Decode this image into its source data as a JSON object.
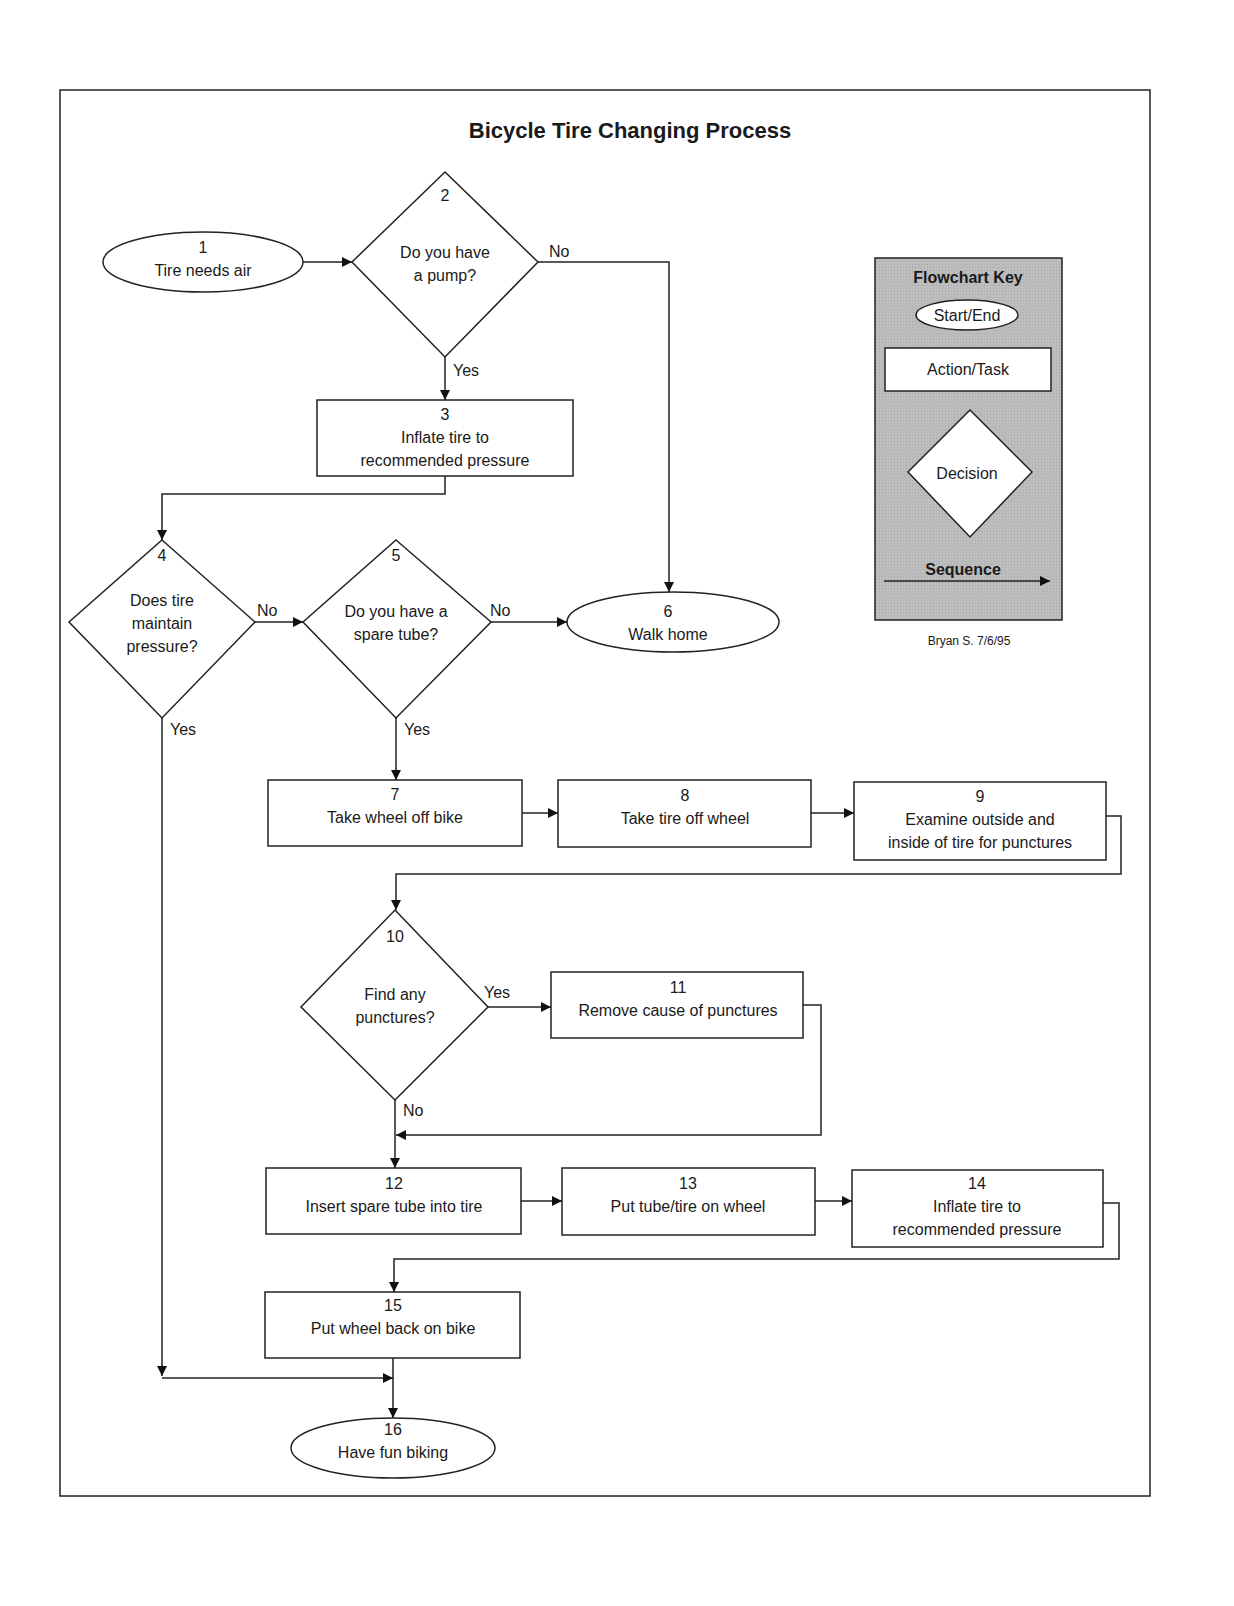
{
  "title": "Bicycle Tire Changing Process",
  "nodes": [
    {
      "id": "1",
      "type": "start-end",
      "label": "Tire needs air"
    },
    {
      "id": "2",
      "type": "decision",
      "label_lines": [
        "Do you have",
        "a pump?"
      ]
    },
    {
      "id": "3",
      "type": "action",
      "label_lines": [
        "Inflate tire to",
        "recommended pressure"
      ]
    },
    {
      "id": "4",
      "type": "decision",
      "label_lines": [
        "Does tire",
        "maintain",
        "pressure?"
      ]
    },
    {
      "id": "5",
      "type": "decision",
      "label_lines": [
        "Do you have a",
        "spare tube?"
      ]
    },
    {
      "id": "6",
      "type": "start-end",
      "label": "Walk home"
    },
    {
      "id": "7",
      "type": "action",
      "label": "Take wheel off bike"
    },
    {
      "id": "8",
      "type": "action",
      "label": "Take tire off wheel"
    },
    {
      "id": "9",
      "type": "action",
      "label_lines": [
        "Examine outside and",
        "inside of tire for punctures"
      ]
    },
    {
      "id": "10",
      "type": "decision",
      "label_lines": [
        "Find any",
        "punctures?"
      ]
    },
    {
      "id": "11",
      "type": "action",
      "label": "Remove cause of punctures"
    },
    {
      "id": "12",
      "type": "action",
      "label": "Insert spare tube into tire"
    },
    {
      "id": "13",
      "type": "action",
      "label": "Put tube/tire on wheel"
    },
    {
      "id": "14",
      "type": "action",
      "label_lines": [
        "Inflate tire to",
        "recommended pressure"
      ]
    },
    {
      "id": "15",
      "type": "action",
      "label": "Put wheel back on bike"
    },
    {
      "id": "16",
      "type": "start-end",
      "label": "Have fun biking"
    }
  ],
  "edges": [
    {
      "from": "1",
      "to": "2",
      "label": ""
    },
    {
      "from": "2",
      "to": "3",
      "label": "Yes"
    },
    {
      "from": "2",
      "to": "6",
      "label": "No"
    },
    {
      "from": "3",
      "to": "4",
      "label": ""
    },
    {
      "from": "4",
      "to": "5",
      "label": "No"
    },
    {
      "from": "4",
      "to": "16",
      "label": "Yes"
    },
    {
      "from": "5",
      "to": "6",
      "label": "No"
    },
    {
      "from": "5",
      "to": "7",
      "label": "Yes"
    },
    {
      "from": "7",
      "to": "8",
      "label": ""
    },
    {
      "from": "8",
      "to": "9",
      "label": ""
    },
    {
      "from": "9",
      "to": "10",
      "label": ""
    },
    {
      "from": "10",
      "to": "11",
      "label": "Yes"
    },
    {
      "from": "10",
      "to": "12",
      "label": "No"
    },
    {
      "from": "11",
      "to": "12",
      "label": ""
    },
    {
      "from": "12",
      "to": "13",
      "label": ""
    },
    {
      "from": "13",
      "to": "14",
      "label": ""
    },
    {
      "from": "14",
      "to": "15",
      "label": ""
    },
    {
      "from": "15",
      "to": "16",
      "label": ""
    }
  ],
  "edge_labels": {
    "yes": "Yes",
    "no": "No"
  },
  "key": {
    "title": "Flowchart Key",
    "start_end": "Start/End",
    "action": "Action/Task",
    "decision": "Decision",
    "sequence": "Sequence",
    "background": "#b8b8b8"
  },
  "author": "Bryan S. 7/6/95"
}
